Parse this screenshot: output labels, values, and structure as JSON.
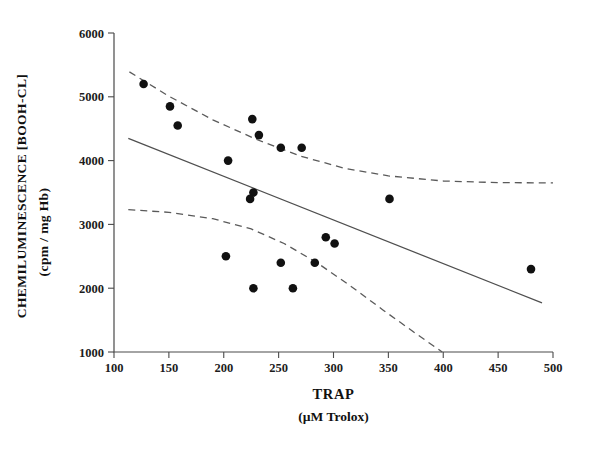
{
  "chart_data": {
    "type": "scatter",
    "title": "",
    "xlabel": "TRAP",
    "xlabel_sub": "(µM Trolox)",
    "ylabel_line1": "CHEMILUMINESCENCE [BOOH-CL]",
    "ylabel_line2": "(cpm / mg Hb)",
    "xlim": [
      100,
      500
    ],
    "ylim": [
      1000,
      6000
    ],
    "xticks": [
      100,
      150,
      200,
      250,
      300,
      350,
      400,
      450,
      500
    ],
    "yticks": [
      1000,
      2000,
      3000,
      4000,
      5000,
      6000
    ],
    "xtick_labels": [
      "100",
      "150",
      "200",
      "250",
      "300",
      "350",
      "400",
      "450",
      "500"
    ],
    "ytick_labels": [
      "1000",
      "2000",
      "3000",
      "4000",
      "5000",
      "6000"
    ],
    "grid": false,
    "legend": "none",
    "marker": "filled-circle",
    "marker_color": "#111111",
    "points": [
      {
        "x": 127,
        "y": 5200
      },
      {
        "x": 151,
        "y": 4850
      },
      {
        "x": 158,
        "y": 4550
      },
      {
        "x": 204,
        "y": 4000
      },
      {
        "x": 226,
        "y": 4650
      },
      {
        "x": 232,
        "y": 4400
      },
      {
        "x": 227,
        "y": 3500
      },
      {
        "x": 224,
        "y": 3400
      },
      {
        "x": 252,
        "y": 4200
      },
      {
        "x": 271,
        "y": 4200
      },
      {
        "x": 202,
        "y": 2500
      },
      {
        "x": 252,
        "y": 2400
      },
      {
        "x": 227,
        "y": 2000
      },
      {
        "x": 263,
        "y": 2000
      },
      {
        "x": 283,
        "y": 2400
      },
      {
        "x": 293,
        "y": 2800
      },
      {
        "x": 301,
        "y": 2700
      },
      {
        "x": 351,
        "y": 3400
      },
      {
        "x": 480,
        "y": 2300
      }
    ],
    "fit_line": {
      "style": "solid",
      "color": "#4f4f4f",
      "points": [
        {
          "x": 113,
          "y": 4350
        },
        {
          "x": 490,
          "y": 1770
        }
      ]
    },
    "confidence_bands": [
      {
        "name": "upper-confidence-band",
        "style": "dashed",
        "color": "#5a5a5a",
        "points": [
          {
            "x": 114,
            "y": 5390
          },
          {
            "x": 150,
            "y": 5010
          },
          {
            "x": 190,
            "y": 4640
          },
          {
            "x": 230,
            "y": 4330
          },
          {
            "x": 270,
            "y": 4070
          },
          {
            "x": 310,
            "y": 3880
          },
          {
            "x": 350,
            "y": 3760
          },
          {
            "x": 400,
            "y": 3680
          },
          {
            "x": 450,
            "y": 3655
          },
          {
            "x": 500,
            "y": 3650
          }
        ]
      },
      {
        "name": "lower-confidence-band",
        "style": "dashed",
        "color": "#5a5a5a",
        "points": [
          {
            "x": 113,
            "y": 3230
          },
          {
            "x": 150,
            "y": 3190
          },
          {
            "x": 190,
            "y": 3090
          },
          {
            "x": 225,
            "y": 2930
          },
          {
            "x": 255,
            "y": 2700
          },
          {
            "x": 285,
            "y": 2400
          },
          {
            "x": 315,
            "y": 2040
          },
          {
            "x": 345,
            "y": 1660
          },
          {
            "x": 375,
            "y": 1290
          },
          {
            "x": 399,
            "y": 1000
          }
        ]
      }
    ]
  }
}
